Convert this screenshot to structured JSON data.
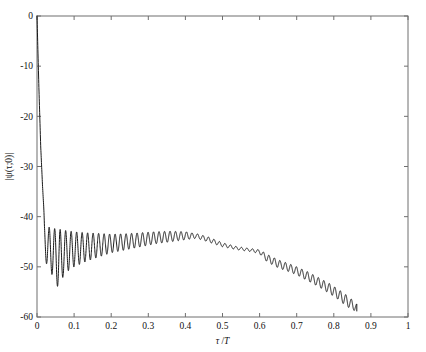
{
  "figure": {
    "width": 426,
    "height": 352,
    "background": "#ffffff",
    "line_color": "#1a1a1a",
    "axis_color": "#6f6f6f"
  },
  "plot_box": {
    "left": 37,
    "top": 16,
    "right": 408,
    "bottom": 317
  },
  "chart_data": {
    "type": "line",
    "title": "",
    "xlabel": "τ /T",
    "xlabel_parts": {
      "tau": "τ",
      "slash": "/",
      "period": "T"
    },
    "ylabel": "|ψ(τ;0)|",
    "xlim": [
      0,
      1
    ],
    "ylim": [
      -60,
      0
    ],
    "xticks": [
      0,
      0.1,
      0.2,
      0.3,
      0.4,
      0.5,
      0.6,
      0.7,
      0.8,
      0.9,
      1
    ],
    "xticklabels": [
      "0",
      "0.1",
      "0.2",
      "0.3",
      "0.4",
      "0.5",
      "0.6",
      "0.7",
      "0.8",
      "0.9",
      "1"
    ],
    "yticks": [
      0,
      -10,
      -20,
      -30,
      -40,
      -50,
      -60
    ],
    "yticklabels": [
      "0",
      "-10",
      "-20",
      "-30",
      "-40",
      "-50",
      "-60"
    ],
    "grid": false,
    "legend": null,
    "ticks_direction": "in",
    "box": true,
    "annotations": [],
    "series": [
      {
        "name": "ambiguity-function-zero-doppler-cut",
        "description": "Main lobe decays from 0 dB at tau=0, then oscillatory sidelobe structure; envelope rises to about -43.5 dB near tau=0.43 then falls, ending near -58 dB at tau=0.86",
        "envelope_upper": [
          [
            0.0,
            0.0
          ],
          [
            0.005,
            -14.0
          ],
          [
            0.01,
            -26.0
          ],
          [
            0.015,
            -34.0
          ],
          [
            0.02,
            -40.5
          ],
          [
            0.03,
            -42.0
          ],
          [
            0.04,
            -42.3
          ],
          [
            0.06,
            -42.5
          ],
          [
            0.08,
            -42.8
          ],
          [
            0.1,
            -43.0
          ],
          [
            0.13,
            -43.2
          ],
          [
            0.16,
            -43.3
          ],
          [
            0.2,
            -43.5
          ],
          [
            0.24,
            -43.4
          ],
          [
            0.28,
            -43.2
          ],
          [
            0.32,
            -43.0
          ],
          [
            0.36,
            -42.9
          ],
          [
            0.4,
            -43.0
          ],
          [
            0.43,
            -43.4
          ],
          [
            0.46,
            -44.0
          ],
          [
            0.5,
            -45.2
          ],
          [
            0.54,
            -46.0
          ],
          [
            0.58,
            -46.4
          ],
          [
            0.6,
            -46.6
          ],
          [
            0.62,
            -47.5
          ],
          [
            0.65,
            -48.6
          ],
          [
            0.68,
            -49.4
          ],
          [
            0.7,
            -50.0
          ],
          [
            0.73,
            -51.0
          ],
          [
            0.76,
            -52.2
          ],
          [
            0.79,
            -53.4
          ],
          [
            0.81,
            -54.4
          ],
          [
            0.83,
            -55.4
          ],
          [
            0.85,
            -56.6
          ],
          [
            0.86,
            -57.4
          ]
        ],
        "envelope_lower": [
          [
            0.02,
            -48.0
          ],
          [
            0.03,
            -50.5
          ],
          [
            0.04,
            -51.5
          ],
          [
            0.05,
            -52.5
          ],
          [
            0.06,
            -55.2
          ],
          [
            0.07,
            -52.0
          ],
          [
            0.08,
            -51.0
          ],
          [
            0.1,
            -50.0
          ],
          [
            0.13,
            -49.0
          ],
          [
            0.16,
            -48.2
          ],
          [
            0.2,
            -47.2
          ],
          [
            0.24,
            -46.6
          ],
          [
            0.28,
            -46.0
          ],
          [
            0.32,
            -45.4
          ],
          [
            0.36,
            -45.0
          ],
          [
            0.4,
            -44.6
          ],
          [
            0.43,
            -44.3
          ],
          [
            0.46,
            -45.0
          ],
          [
            0.5,
            -46.0
          ],
          [
            0.54,
            -46.6
          ],
          [
            0.58,
            -47.0
          ],
          [
            0.6,
            -47.4
          ],
          [
            0.62,
            -49.0
          ],
          [
            0.65,
            -50.2
          ],
          [
            0.68,
            -51.0
          ],
          [
            0.7,
            -51.6
          ],
          [
            0.73,
            -52.8
          ],
          [
            0.76,
            -54.0
          ],
          [
            0.79,
            -55.4
          ],
          [
            0.81,
            -56.4
          ],
          [
            0.83,
            -57.6
          ],
          [
            0.85,
            -58.6
          ],
          [
            0.86,
            -58.8
          ]
        ],
        "oscillation": {
          "start_tau": 0.018,
          "end_tau": 0.862,
          "cycles": 57,
          "note": "ripple frequency roughly constant in tau; amplitude set by envelope pair"
        }
      }
    ]
  }
}
